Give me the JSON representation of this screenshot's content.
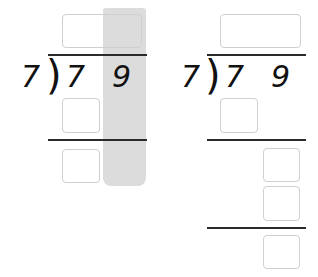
{
  "colors": {
    "highlight": "#dcdcdc",
    "box_border": "#cfcfcf",
    "line": "#2a2a2a",
    "text": "#111111"
  },
  "left_problem": {
    "divisor": "7",
    "dividend_digits": [
      "7",
      "9"
    ],
    "bracket": ")",
    "highlighted_column": "ones",
    "boxes": [
      "quotient",
      "product-1",
      "difference-1"
    ]
  },
  "right_problem": {
    "divisor": "7",
    "dividend_digits": [
      "7",
      "9"
    ],
    "bracket": ")",
    "boxes": [
      "quotient",
      "product-1",
      "bring-down-1",
      "bring-down-2",
      "remainder"
    ]
  }
}
